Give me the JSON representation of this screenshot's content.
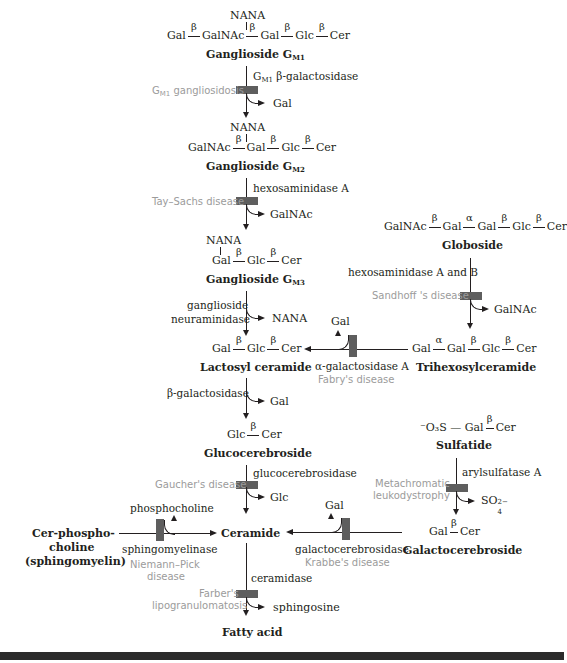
{
  "diagram": {
    "colors": {
      "line": "#231f20",
      "block": "#5e5e5e",
      "disease_text": "#9b9b9b",
      "bottom_bar": "#2b2b2b"
    },
    "gm1": {
      "branch": "NANA",
      "chain": [
        "Gal",
        "β",
        "GalNAc",
        "β",
        "Gal",
        "β",
        "Glc",
        "β",
        "Cer"
      ],
      "name": "Ganglioside G",
      "name_sub": "M1",
      "enzyme": "β-galactosidase",
      "enzyme_prefix": "G",
      "enzyme_prefix_sub": "M1",
      "disease": "gangliosidosis",
      "disease_prefix": "G",
      "disease_prefix_sub": "M1",
      "product": "Gal"
    },
    "gm2": {
      "branch": "NANA",
      "chain": [
        "GalNAc",
        "β",
        "Gal",
        "β",
        "Glc",
        "β",
        "Cer"
      ],
      "name": "Ganglioside G",
      "name_sub": "M2",
      "enzyme": "hexosaminidase A",
      "disease": "Tay–Sachs disease",
      "product": "GalNAc"
    },
    "gm3": {
      "branch": "NANA",
      "chain": [
        "Gal",
        "β",
        "Glc",
        "β",
        "Cer"
      ],
      "name": "Ganglioside G",
      "name_sub": "M3",
      "enzyme_line1": "ganglioside",
      "enzyme_line2": "neuraminidase",
      "product": "NANA"
    },
    "globoside": {
      "chain": [
        "GalNAc",
        "β",
        "Gal",
        "α",
        "Gal",
        "β",
        "Glc",
        "β",
        "Cer"
      ],
      "name": "Globoside",
      "enzyme": "hexosaminidase A and B",
      "disease": "Sandhoff 's disease",
      "product": "GalNAc"
    },
    "trihexosyl": {
      "chain": [
        "Gal",
        "α",
        "Gal",
        "β",
        "Glc",
        "β",
        "Cer"
      ],
      "name": "Trihexosylceramide",
      "enzyme": "α-galactosidase A",
      "disease": "Fabry's disease",
      "product": "Gal"
    },
    "lactosyl": {
      "chain": [
        "Gal",
        "β",
        "Glc",
        "β",
        "Cer"
      ],
      "name": "Lactosyl ceramide",
      "enzyme": "β-galactosidase",
      "product": "Gal"
    },
    "glucocerebroside": {
      "chain": [
        "Glc",
        "β",
        "Cer"
      ],
      "name": "Glucocerebroside",
      "enzyme": "glucocerebrosidase",
      "disease": "Gaucher's disease",
      "product": "Glc"
    },
    "sulfatide": {
      "chain_prefix": "⁻O₃S — Gal",
      "link": "β",
      "chain_end": "Cer",
      "name": "Sulfatide",
      "enzyme": "arylsulfatase A",
      "disease_line1": "Metachromatic",
      "disease_line2": "leukodystrophy",
      "product": "SO",
      "product_sub": "4",
      "product_sup": "2−"
    },
    "galactocerebroside": {
      "chain": [
        "Gal",
        "β",
        "Cer"
      ],
      "name": "Galactocerebroside",
      "enzyme": "galactocerebrosidase",
      "disease": "Krabbe's disease",
      "product": "Gal"
    },
    "sphingomyelin": {
      "name_line1": "Cer-phospho-",
      "name_line2": "choline",
      "name_line3": "(sphingomyelin)",
      "enzyme": "sphingomyelinase",
      "disease_line1": "Niemann–Pick",
      "disease_line2": "disease",
      "product": "phosphocholine"
    },
    "ceramide": {
      "name": "Ceramide",
      "enzyme": "ceramidase",
      "disease_line1": "Farber's",
      "disease_line2": "lipogranulomatosis",
      "product": "sphingosine"
    },
    "fatty_acid": {
      "name": "Fatty acid"
    }
  }
}
